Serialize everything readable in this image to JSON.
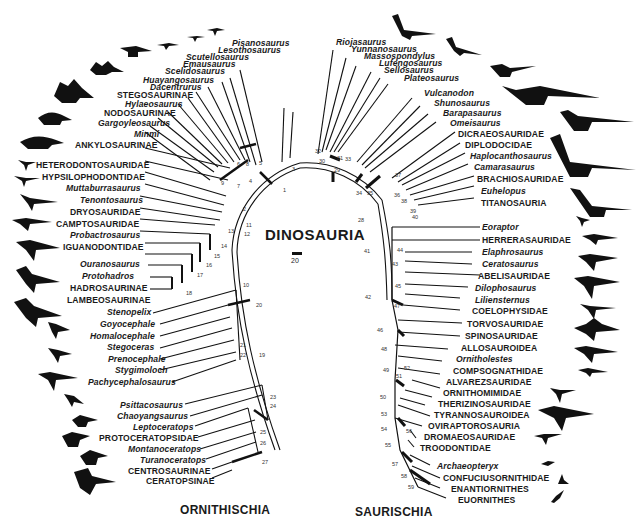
{
  "diagram": {
    "type": "phylogenetic-cladogram",
    "center_title": "DINOSAURIA",
    "scale_bar_label": "20",
    "clades": [
      {
        "name": "ORNITHISCHIA"
      },
      {
        "name": "SAURISCHIA"
      }
    ],
    "ornithischia_taxa": [
      {
        "name": "Pisanosaurus",
        "italic": true
      },
      {
        "name": "Lesothosaurus",
        "italic": true
      },
      {
        "name": "Scutellosaurus",
        "italic": true
      },
      {
        "name": "Emausaurus",
        "italic": true
      },
      {
        "name": "Scelidosaurus",
        "italic": true
      },
      {
        "name": "Huayangosaurus",
        "italic": true
      },
      {
        "name": "Dacentrurus",
        "italic": true
      },
      {
        "name": "STEGOSAURINAE",
        "italic": false
      },
      {
        "name": "Hylaeosaurus",
        "italic": true
      },
      {
        "name": "NODOSAURINAE",
        "italic": false
      },
      {
        "name": "Gargoyleosaurus",
        "italic": true
      },
      {
        "name": "Minmi",
        "italic": true
      },
      {
        "name": "ANKYLOSAURINAE",
        "italic": false
      },
      {
        "name": "HETERODONTOSAURIDAE",
        "italic": false
      },
      {
        "name": "HYPSILOPHODONTIDAE",
        "italic": false
      },
      {
        "name": "Muttaburrasaurus",
        "italic": true
      },
      {
        "name": "Tenontosaurus",
        "italic": true
      },
      {
        "name": "DRYOSAURIDAE",
        "italic": false
      },
      {
        "name": "CAMPTOSAURIDAE",
        "italic": false
      },
      {
        "name": "Probactrosaurus",
        "italic": true
      },
      {
        "name": "IGUANODONTIDAE",
        "italic": false
      },
      {
        "name": "Ouranosaurus",
        "italic": true
      },
      {
        "name": "Protohadros",
        "italic": true
      },
      {
        "name": "HADROSAURINAE",
        "italic": false
      },
      {
        "name": "LAMBEOSAURINAE",
        "italic": false
      },
      {
        "name": "Stenopelix",
        "italic": true
      },
      {
        "name": "Goyocephale",
        "italic": true
      },
      {
        "name": "Homalocephale",
        "italic": true
      },
      {
        "name": "Stegoceras",
        "italic": true
      },
      {
        "name": "Prenocephale",
        "italic": true
      },
      {
        "name": "Stygimoloch",
        "italic": true
      },
      {
        "name": "Pachycephalosaurus",
        "italic": true
      },
      {
        "name": "Psittacosaurus",
        "italic": true
      },
      {
        "name": "Chaoyangsaurus",
        "italic": true
      },
      {
        "name": "Leptoceratops",
        "italic": true
      },
      {
        "name": "PROTOCERATOPSIDAE",
        "italic": false
      },
      {
        "name": "Montanoceratops",
        "italic": true
      },
      {
        "name": "Turanoceratops",
        "italic": true
      },
      {
        "name": "CENTROSAURINAE",
        "italic": false
      },
      {
        "name": "CERATOPSINAE",
        "italic": false
      }
    ],
    "saurischia_taxa": [
      {
        "name": "Riojasaurus",
        "italic": true
      },
      {
        "name": "Yunnanosaurus",
        "italic": true
      },
      {
        "name": "Massospondylus",
        "italic": true
      },
      {
        "name": "Lufengosaurus",
        "italic": true
      },
      {
        "name": "Sellosaurus",
        "italic": true
      },
      {
        "name": "Plateosaurus",
        "italic": true
      },
      {
        "name": "Vulcanodon",
        "italic": true
      },
      {
        "name": "Shunosaurus",
        "italic": true
      },
      {
        "name": "Barapasaurus",
        "italic": true
      },
      {
        "name": "Omeisaurus",
        "italic": true
      },
      {
        "name": "DICRAEOSAURIDAE",
        "italic": false
      },
      {
        "name": "DIPLODOCIDAE",
        "italic": false
      },
      {
        "name": "Haplocanthosaurus",
        "italic": true
      },
      {
        "name": "Camarasaurus",
        "italic": true
      },
      {
        "name": "BRACHIOSAURIDAE",
        "italic": false
      },
      {
        "name": "Euhelopus",
        "italic": true
      },
      {
        "name": "TITANOSAURIA",
        "italic": false
      },
      {
        "name": "Eoraptor",
        "italic": true
      },
      {
        "name": "HERRERASAURIDAE",
        "italic": false
      },
      {
        "name": "Elaphrosaurus",
        "italic": true
      },
      {
        "name": "Ceratosaurus",
        "italic": true
      },
      {
        "name": "ABELISAURIDAE",
        "italic": false
      },
      {
        "name": "Dilophosaurus",
        "italic": true
      },
      {
        "name": "Liliensternus",
        "italic": true
      },
      {
        "name": "COELOPHYSIDAE",
        "italic": false
      },
      {
        "name": "TORVOSAURIDAE",
        "italic": false
      },
      {
        "name": "SPINOSAURIDAE",
        "italic": false
      },
      {
        "name": "ALLOSAUROIDEA",
        "italic": false
      },
      {
        "name": "Ornitholestes",
        "italic": true
      },
      {
        "name": "COMPSOGNATHIDAE",
        "italic": false
      },
      {
        "name": "ALVAREZSAURIDAE",
        "italic": false
      },
      {
        "name": "ORNITHOMIMIDAE",
        "italic": false
      },
      {
        "name": "THERIZINOSAURIDAE",
        "italic": false
      },
      {
        "name": "TYRANNOSAUROIDEA",
        "italic": false
      },
      {
        "name": "OVIRAPTOROSAURIA",
        "italic": false
      },
      {
        "name": "DROMAEOSAURIDAE",
        "italic": false
      },
      {
        "name": "TROODONTIDAE",
        "italic": false
      },
      {
        "name": "Archaeopteryx",
        "italic": true
      },
      {
        "name": "CONFUCIUSORNITHIDAE",
        "italic": false
      },
      {
        "name": "ENANTIORNITHES",
        "italic": false
      },
      {
        "name": "EUORNITHES",
        "italic": false
      }
    ],
    "node_numbers": [
      "1",
      "2",
      "3",
      "4",
      "5",
      "6",
      "7",
      "8",
      "9",
      "10",
      "11",
      "12",
      "13",
      "14",
      "15",
      "16",
      "17",
      "18",
      "19",
      "20",
      "21",
      "22",
      "23",
      "24",
      "25",
      "26",
      "27",
      "28",
      "29",
      "30",
      "31",
      "32",
      "33",
      "34",
      "35",
      "36",
      "37",
      "38",
      "39",
      "40",
      "41",
      "42",
      "43",
      "44",
      "45",
      "46",
      "47",
      "48",
      "49",
      "50",
      "51",
      "52",
      "53",
      "54",
      "55",
      "56",
      "57",
      "58",
      "59"
    ],
    "silhouettes": [
      "ornithopod-small-icon",
      "stegosaur-icon",
      "ankylosaur-icon",
      "iguanodont-icon",
      "hadrosaur-icon",
      "pachycephalosaur-icon",
      "ceratopsian-icon",
      "prosauropod-icon",
      "sauropod-icon",
      "theropod-icon",
      "tyrannosaur-icon",
      "bird-icon"
    ]
  }
}
